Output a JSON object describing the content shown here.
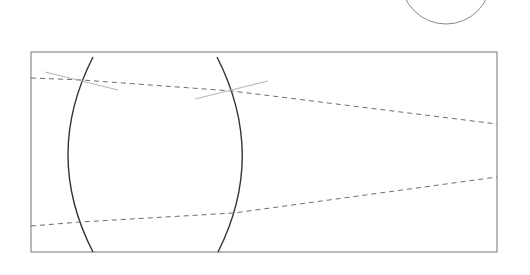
{
  "diagram": {
    "type": "optics-lens-ray-diagram",
    "width": 530,
    "height": 275,
    "colors": {
      "background": "#ffffff",
      "frame": "#8a8a8a",
      "lens": "#333333",
      "ray": "#6e6e6e",
      "normal": "#b4b4b4",
      "circle": "#8a8a8a"
    },
    "circle": {
      "cx": 446,
      "cy": -21,
      "r": 45
    },
    "frame": {
      "x": 31,
      "y": 52,
      "width": 466,
      "height": 200
    },
    "lens": {
      "left_surface": {
        "top": [
          93,
          57
        ],
        "control": [
          43,
          155
        ],
        "bottom": [
          93,
          252
        ]
      },
      "right_surface": {
        "top": [
          217,
          57
        ],
        "control": [
          267,
          155
        ],
        "bottom": [
          218,
          252
        ]
      }
    },
    "rays": [
      {
        "name": "upper-ray",
        "points": [
          [
            31,
            78
          ],
          [
            82,
            80
          ],
          [
            232,
            91
          ],
          [
            497,
            124
          ]
        ]
      },
      {
        "name": "lower-ray",
        "points": [
          [
            31,
            226
          ],
          [
            80,
            222
          ],
          [
            234,
            213
          ],
          [
            497,
            177
          ]
        ]
      }
    ],
    "normals": [
      {
        "name": "normal-left-surface",
        "from": [
          45,
          72
        ],
        "to": [
          118,
          90
        ]
      },
      {
        "name": "normal-right-surface",
        "from": [
          195,
          99
        ],
        "to": [
          268,
          81
        ]
      }
    ]
  }
}
